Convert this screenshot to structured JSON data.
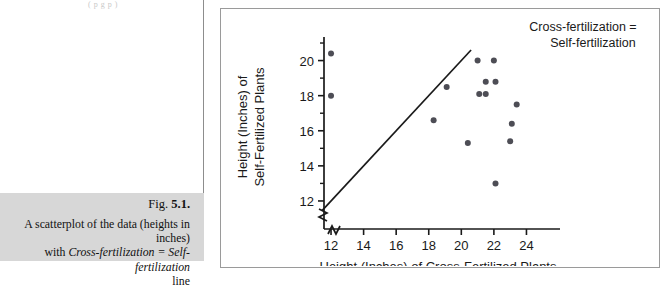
{
  "page": {
    "top_fragment": "( p g p )",
    "figure_number_prefix": "Fig. ",
    "figure_number": "5.1.",
    "caption_line1": "A scatterplot of the data (heights in inches)",
    "caption_line2_pre": "with ",
    "caption_line2_em": "Cross-fertilization = Self-fertilization",
    "caption_line3": "line"
  },
  "colors": {
    "frame_border": "#9a9a9a",
    "caption_band": "#d7d7d7",
    "rule": "#8d8d8d",
    "axis": "#1a1a1a",
    "point_fill": "#4d4d55",
    "line": "#1a1a1a",
    "text": "#1a1a1a"
  },
  "chart_data": {
    "type": "scatter",
    "title": "",
    "xlabel": "Height (Inches) of Cross-Fertilized Plants",
    "ylabel": "Height (Inches) of Self-Fertilized Plants",
    "ylabel_line1": "Height (Inches) of",
    "ylabel_line2": "Self-Fertilized Plants",
    "xticks": [
      12,
      14,
      16,
      18,
      20,
      22,
      24
    ],
    "yticks": [
      12,
      14,
      16,
      18,
      20
    ],
    "xtick_labels": [
      "12",
      "14",
      "16",
      "18",
      "20",
      "22",
      "24"
    ],
    "ytick_labels": [
      "12",
      "14",
      "16",
      "18",
      "20"
    ],
    "xlim": [
      11.2,
      25.2
    ],
    "ylim": [
      11.2,
      21.4
    ],
    "minor_ticks": true,
    "axis_break": true,
    "grid": false,
    "legend": "none",
    "annotations": [
      {
        "text": "Cross-fertilization = Self-fertilization",
        "line1": "Cross-fertilization =",
        "line2": "Self-fertilization",
        "x": 22.6,
        "y": 21.2
      }
    ],
    "reference_line": {
      "label": "Cross-fertilization = Self-fertilization",
      "slope": 1,
      "intercept": 0,
      "x_start": 11.45,
      "y_start": 11.45,
      "x_end": 20.6,
      "y_end": 20.6
    },
    "points": [
      {
        "x": 12.0,
        "y": 20.4
      },
      {
        "x": 12.0,
        "y": 18.0
      },
      {
        "x": 18.3,
        "y": 16.6
      },
      {
        "x": 19.1,
        "y": 18.5
      },
      {
        "x": 20.4,
        "y": 15.3
      },
      {
        "x": 21.0,
        "y": 20.0
      },
      {
        "x": 21.1,
        "y": 18.1
      },
      {
        "x": 21.5,
        "y": 18.8
      },
      {
        "x": 21.5,
        "y": 18.1
      },
      {
        "x": 22.0,
        "y": 20.0
      },
      {
        "x": 22.1,
        "y": 18.8
      },
      {
        "x": 22.1,
        "y": 13.0
      },
      {
        "x": 23.0,
        "y": 15.4
      },
      {
        "x": 23.1,
        "y": 16.4
      },
      {
        "x": 23.4,
        "y": 17.5
      }
    ]
  }
}
